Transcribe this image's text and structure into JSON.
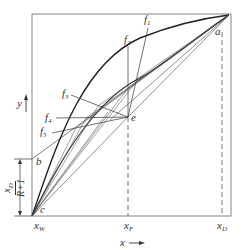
{
  "diagram": {
    "type": "x-y distillation diagram (McCabe-Thiele style)",
    "axes": {
      "x_label": "x",
      "y_label": "y",
      "x_ticks": [
        {
          "label": "x",
          "sub": "W"
        },
        {
          "label": "x",
          "sub": "F"
        },
        {
          "label": "x",
          "sub": "D"
        }
      ]
    },
    "points": {
      "a": "a",
      "b": "b",
      "c": "c",
      "e": "e"
    },
    "feed_lines": [
      {
        "label": "f",
        "sub": "1"
      },
      {
        "label": "f",
        "sub": "2"
      },
      {
        "label": "f",
        "sub": "3"
      },
      {
        "label": "f",
        "sub": "4"
      },
      {
        "label": "f",
        "sub": "5"
      }
    ],
    "intercept": {
      "numerator": "x_D",
      "numerator_main": "x",
      "numerator_sub": "D",
      "denominator": "R+1"
    },
    "colors": {
      "line": "#333333",
      "frame": "#555555",
      "background": "#ffffff"
    }
  }
}
